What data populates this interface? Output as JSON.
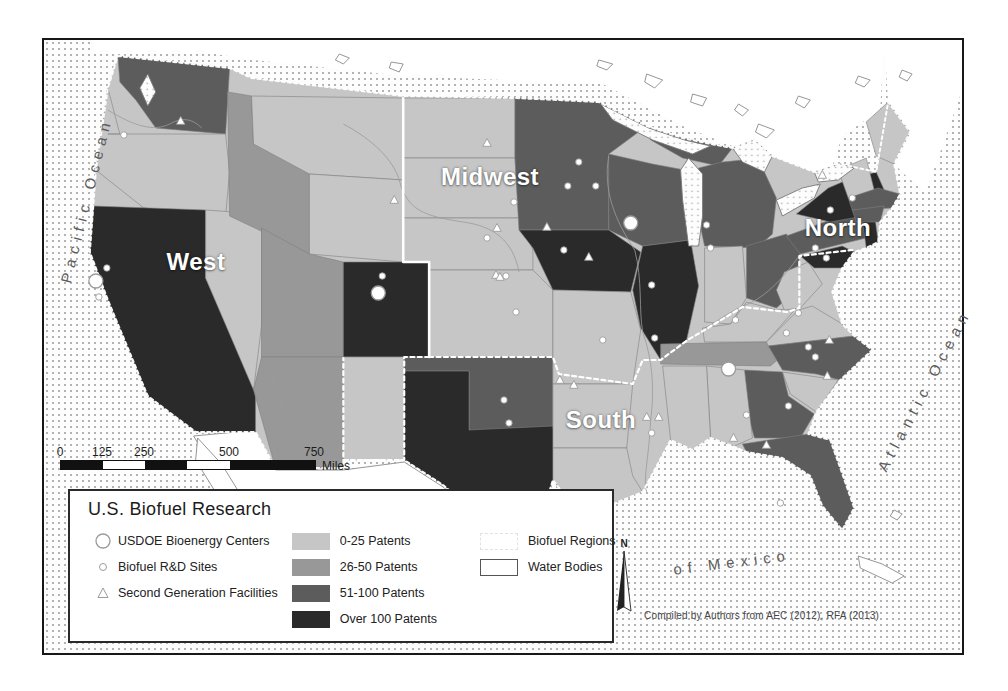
{
  "legend": {
    "title": "U.S. Biofuel Research",
    "point_items": [
      {
        "symbol": "usdoe-center-icon",
        "label": "USDOE Bioenergy Centers"
      },
      {
        "symbol": "rd-site-icon",
        "label": "Biofuel R&D Sites"
      },
      {
        "symbol": "second-gen-icon",
        "label": "Second Generation Facilities"
      }
    ],
    "choropleth": [
      {
        "cls": "c1",
        "label": "0-25 Patents",
        "color": "#c6c6c6"
      },
      {
        "cls": "c2",
        "label": "26-50 Patents",
        "color": "#989898"
      },
      {
        "cls": "c3",
        "label": "51-100 Patents",
        "color": "#5c5c5c"
      },
      {
        "cls": "c4",
        "label": "Over 100 Patents",
        "color": "#2a2a2a"
      }
    ],
    "area_items": [
      {
        "type": "regions",
        "label": "Biofuel Regions"
      },
      {
        "type": "water",
        "label": "Water Bodies"
      }
    ]
  },
  "scalebar": {
    "ticks": [
      {
        "label": "0",
        "x": 0
      },
      {
        "label": "125",
        "x": 42
      },
      {
        "label": "250",
        "x": 84
      },
      {
        "label": "500",
        "x": 169
      },
      {
        "label": "750",
        "x": 254
      }
    ],
    "segments": [
      {
        "w": 42,
        "color": "#111111"
      },
      {
        "w": 42,
        "color": "#ffffff"
      },
      {
        "w": 42,
        "color": "#111111"
      },
      {
        "w": 43,
        "color": "#ffffff"
      },
      {
        "w": 85,
        "color": "#111111"
      }
    ],
    "unit": "Miles"
  },
  "north_indicator": {
    "label": "N"
  },
  "attribution": "Compiled by Authors from AEC (2012), RFA (2013)",
  "map": {
    "region_labels": [
      {
        "name": "west",
        "text": "West",
        "x": 152,
        "y": 222
      },
      {
        "name": "midwest",
        "text": "Midwest",
        "x": 446,
        "y": 137
      },
      {
        "name": "north",
        "text": "North",
        "x": 794,
        "y": 188
      },
      {
        "name": "south",
        "text": "South",
        "x": 557,
        "y": 380
      }
    ],
    "ocean_labels": [
      {
        "name": "pacific-ocean",
        "text": "Pacific Ocean",
        "x": 42,
        "y": 160,
        "rot": -76
      },
      {
        "name": "atlantic-ocean",
        "text": "Atlantic Ocean",
        "x": 880,
        "y": 350,
        "rot": -62
      },
      {
        "name": "gulf-of-mexico",
        "text": "of Mexico",
        "x": 688,
        "y": 522,
        "rot": -7
      }
    ],
    "states": [
      {
        "id": "WA",
        "name": "Washington",
        "cls": "c3"
      },
      {
        "id": "OR",
        "name": "Oregon",
        "cls": "c1"
      },
      {
        "id": "CA",
        "name": "California",
        "cls": "c4"
      },
      {
        "id": "ID",
        "name": "Idaho",
        "cls": "c2"
      },
      {
        "id": "NV",
        "name": "Nevada",
        "cls": "c1"
      },
      {
        "id": "UT",
        "name": "Utah",
        "cls": "c2"
      },
      {
        "id": "AZ",
        "name": "Arizona",
        "cls": "c2"
      },
      {
        "id": "MT",
        "name": "Montana",
        "cls": "c1"
      },
      {
        "id": "WY",
        "name": "Wyoming",
        "cls": "c1"
      },
      {
        "id": "CO",
        "name": "Colorado",
        "cls": "c4"
      },
      {
        "id": "NM",
        "name": "New Mexico",
        "cls": "c1"
      },
      {
        "id": "ND",
        "name": "North Dakota",
        "cls": "c1"
      },
      {
        "id": "SD",
        "name": "South Dakota",
        "cls": "c1"
      },
      {
        "id": "NE",
        "name": "Nebraska",
        "cls": "c1"
      },
      {
        "id": "KS",
        "name": "Kansas",
        "cls": "c1"
      },
      {
        "id": "OK",
        "name": "Oklahoma",
        "cls": "c3"
      },
      {
        "id": "TX",
        "name": "Texas",
        "cls": "c4"
      },
      {
        "id": "MN",
        "name": "Minnesota",
        "cls": "c3"
      },
      {
        "id": "IA",
        "name": "Iowa",
        "cls": "c4"
      },
      {
        "id": "MO",
        "name": "Missouri",
        "cls": "c1"
      },
      {
        "id": "AR",
        "name": "Arkansas",
        "cls": "c1"
      },
      {
        "id": "LA",
        "name": "Louisiana",
        "cls": "c1"
      },
      {
        "id": "WI",
        "name": "Wisconsin",
        "cls": "c3"
      },
      {
        "id": "IL",
        "name": "Illinois",
        "cls": "c4"
      },
      {
        "id": "MIUP",
        "name": "Michigan Upper Peninsula",
        "cls": "c3"
      },
      {
        "id": "MI",
        "name": "Michigan",
        "cls": "c3"
      },
      {
        "id": "IN",
        "name": "Indiana",
        "cls": "c1"
      },
      {
        "id": "OH",
        "name": "Ohio",
        "cls": "c3"
      },
      {
        "id": "KY",
        "name": "Kentucky",
        "cls": "c1"
      },
      {
        "id": "TN",
        "name": "Tennessee",
        "cls": "c2"
      },
      {
        "id": "WV",
        "name": "West Virginia",
        "cls": "c1"
      },
      {
        "id": "VA",
        "name": "Virginia",
        "cls": "c1"
      },
      {
        "id": "NC",
        "name": "North Carolina",
        "cls": "c3"
      },
      {
        "id": "SC",
        "name": "South Carolina",
        "cls": "c1"
      },
      {
        "id": "GA",
        "name": "Georgia",
        "cls": "c3"
      },
      {
        "id": "AL",
        "name": "Alabama",
        "cls": "c1"
      },
      {
        "id": "MS",
        "name": "Mississippi",
        "cls": "c1"
      },
      {
        "id": "FL",
        "name": "Florida",
        "cls": "c3"
      },
      {
        "id": "PA",
        "name": "Pennsylvania",
        "cls": "c3"
      },
      {
        "id": "NY",
        "name": "New York",
        "cls": "c4"
      },
      {
        "id": "NJ",
        "name": "New Jersey",
        "cls": "c4"
      },
      {
        "id": "MDDE",
        "name": "Maryland-Delaware",
        "cls": "c4"
      },
      {
        "id": "VTNH",
        "name": "Vermont-New Hampshire",
        "cls": "c1"
      },
      {
        "id": "ME",
        "name": "Maine",
        "cls": "c1"
      },
      {
        "id": "MA",
        "name": "Massachusetts",
        "cls": "c3"
      },
      {
        "id": "CTRI",
        "name": "Connecticut-Rhode Island",
        "cls": "c3"
      }
    ],
    "symbols": {
      "usdoe_centers": [
        [
          52,
          241
        ],
        [
          335,
          253
        ],
        [
          588,
          183
        ],
        [
          686,
          329
        ]
      ],
      "rd_sites": [
        [
          80,
          95
        ],
        [
          63,
          228
        ],
        [
          55,
          257
        ],
        [
          339,
          236
        ],
        [
          536,
          122
        ],
        [
          525,
          146
        ],
        [
          553,
          146
        ],
        [
          471,
          162
        ],
        [
          463,
          236
        ],
        [
          473,
          272
        ],
        [
          444,
          198
        ],
        [
          560,
          300
        ],
        [
          461,
          360
        ],
        [
          466,
          383
        ],
        [
          609,
          245
        ],
        [
          612,
          298
        ],
        [
          521,
          210
        ],
        [
          664,
          185
        ],
        [
          668,
          208
        ],
        [
          773,
          208
        ],
        [
          788,
          170
        ],
        [
          810,
          158
        ],
        [
          744,
          293
        ],
        [
          756,
          273
        ],
        [
          766,
          307
        ],
        [
          773,
          317
        ],
        [
          746,
          366
        ],
        [
          704,
          375
        ],
        [
          738,
          463
        ],
        [
          693,
          280
        ],
        [
          609,
          393
        ],
        [
          784,
          218
        ]
      ],
      "second_gen": [
        [
          137,
          81
        ],
        [
          351,
          160
        ],
        [
          444,
          103
        ],
        [
          454,
          188
        ],
        [
          453,
          235
        ],
        [
          504,
          187
        ],
        [
          546,
          217
        ],
        [
          457,
          237
        ],
        [
          517,
          340
        ],
        [
          531,
          345
        ],
        [
          604,
          377
        ],
        [
          616,
          377
        ],
        [
          691,
          398
        ],
        [
          724,
          405
        ],
        [
          787,
          300
        ],
        [
          785,
          336
        ],
        [
          780,
          135
        ]
      ]
    }
  }
}
